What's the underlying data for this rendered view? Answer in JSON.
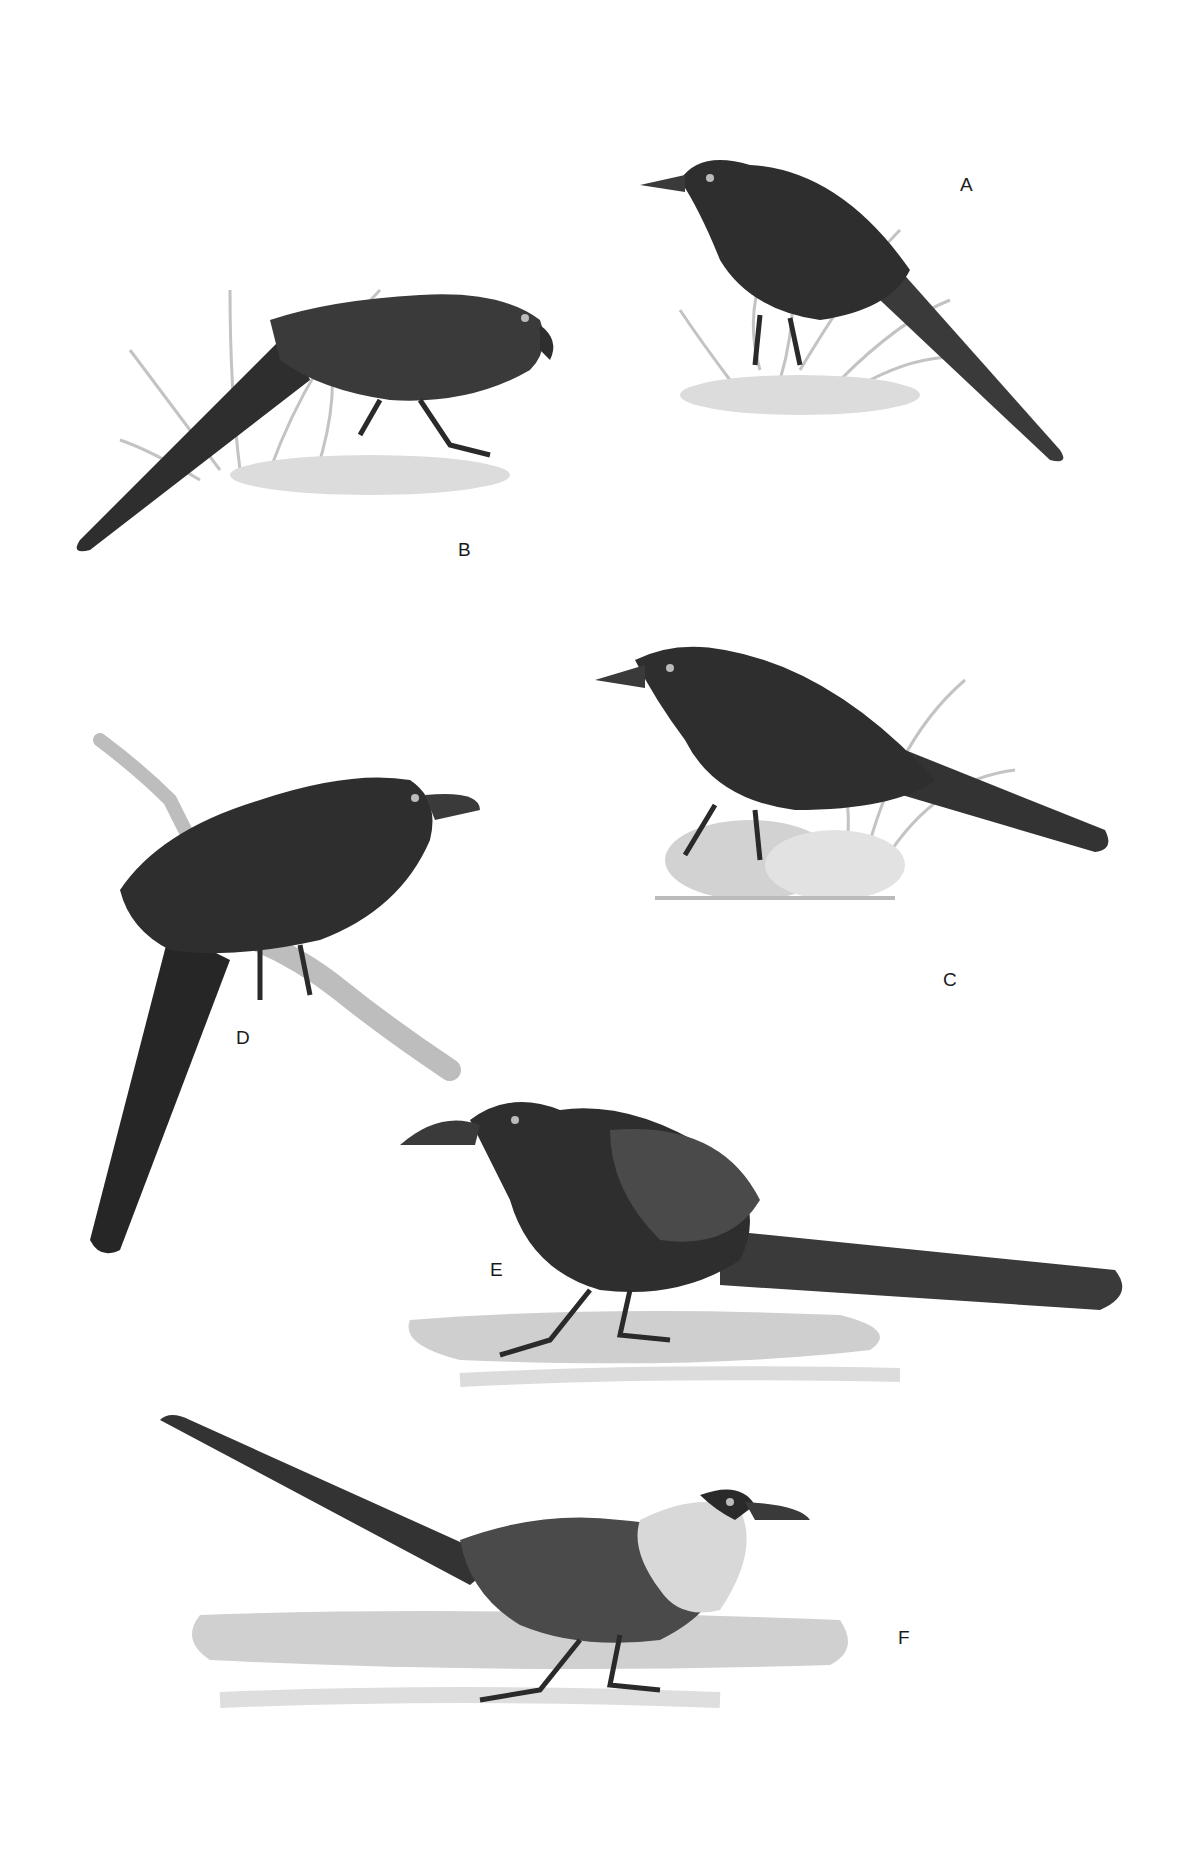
{
  "plate": {
    "background": "#ffffff",
    "style": "monochrome illustration plate",
    "figures": [
      {
        "id": "A",
        "label": "A",
        "description": "dark bird perched among grass, facing left, long tail down-right"
      },
      {
        "id": "B",
        "label": "B",
        "description": "dark bird crouching in grass, facing right, long tail down-left"
      },
      {
        "id": "C",
        "label": "C",
        "description": "dark bird on rocks with grass, facing left, long tail to right"
      },
      {
        "id": "D",
        "label": "D",
        "description": "dark bird perched on branch, facing right, long tail hanging down"
      },
      {
        "id": "E",
        "label": "E",
        "description": "dark-headed bird on ground, facing left, long tail to right"
      },
      {
        "id": "F",
        "label": "F",
        "description": "pale-headed bird with dark mask on ground, facing right, long tail raised up-left"
      }
    ]
  },
  "colors": {
    "ink_dark": "#2a2a2a",
    "ink_mid": "#4a4a4a",
    "ink_light": "#8a8a8a",
    "ground": "#cfcfcf",
    "grass": "#b5b5b5",
    "pale_head": "#d8d8d8"
  }
}
